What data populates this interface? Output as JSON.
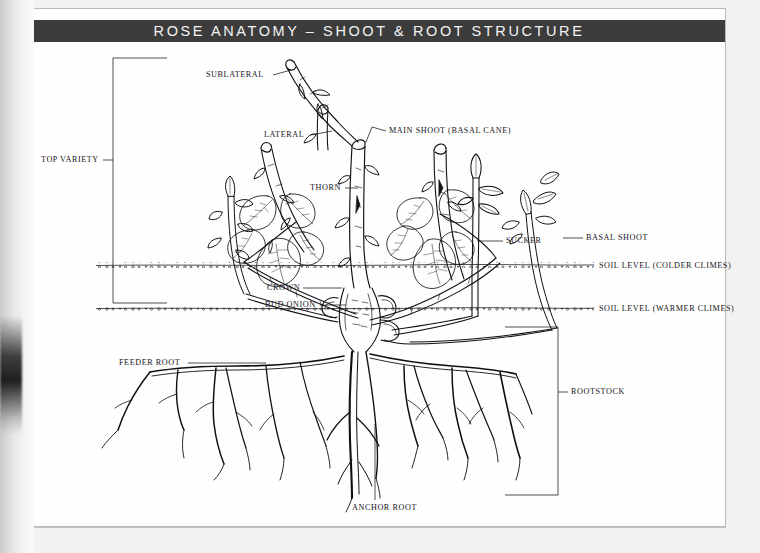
{
  "document": {
    "title": "ROSE ANATOMY – SHOOT & ROOT STRUCTURE",
    "subject": "rose-plant-anatomy-diagram",
    "illustration_style": "pen-and-ink line drawing"
  },
  "brackets": [
    {
      "id": "top-variety",
      "label": "TOP VARIETY",
      "side": "left"
    },
    {
      "id": "rootstock",
      "label": "ROOTSTOCK",
      "side": "right"
    }
  ],
  "soil_lines": [
    {
      "id": "colder",
      "label": "SOIL LEVEL (COLDER CLIMES)"
    },
    {
      "id": "warmer",
      "label": "SOIL LEVEL (WARMER CLIMES)"
    }
  ],
  "labels": {
    "sublateral": "SUBLATERAL",
    "lateral": "LATERAL",
    "thorn": "THORN",
    "main_shoot": "MAIN SHOOT (BASAL CANE)",
    "sucker": "SUCKER",
    "basal_shoot": "BASAL SHOOT",
    "crown": "CROWN",
    "bud_onion": "BUD ONION",
    "feeder_root": "FEEDER ROOT",
    "anchor_root": "ANCHOR ROOT",
    "rootstock": "ROOTSTOCK",
    "top_variety": "TOP VARIETY",
    "soil_colder": "SOIL LEVEL (COLDER CLIMES)",
    "soil_warmer": "SOIL LEVEL (WARMER CLIMES)"
  },
  "colors": {
    "ink": "#15151a",
    "title_bar": "#3c3c3c",
    "title_text": "#f3f3f3",
    "page": "#fefefe",
    "page_border": "#b9b9b7",
    "scan_background": "#f2f2f1"
  }
}
